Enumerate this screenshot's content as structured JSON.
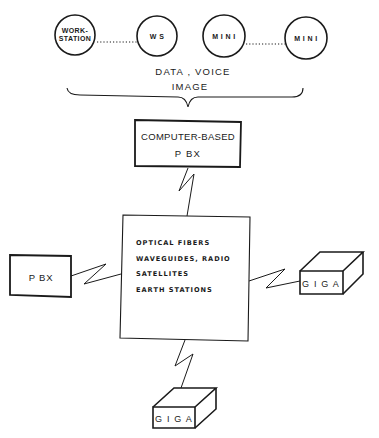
{
  "diagram": {
    "terminals": [
      {
        "id": "workstation",
        "label_line1": "WORK-",
        "label_line2": "STATION"
      },
      {
        "id": "ws",
        "label": "W S"
      },
      {
        "id": "mini1",
        "label": "M I N I"
      },
      {
        "id": "mini2",
        "label": "M I N I"
      }
    ],
    "traffic_label": {
      "line1": "DATA , VOICE",
      "line2": "IMAGE"
    },
    "computer_pbx": {
      "line1": "COMPUTER-BASED",
      "line2": "P BX"
    },
    "network": {
      "items": [
        "OPTICAL  FIBERS",
        "WAVEGUIDES, RADIO",
        "SATELLITES",
        "EARTH  STATIONS"
      ]
    },
    "pbx": {
      "label": "P BX"
    },
    "giga_right": {
      "label": "G I G A"
    },
    "giga_bottom": {
      "label": "G I G A"
    },
    "colors": {
      "ink": "#1a1a1a",
      "background": "#ffffff"
    }
  }
}
